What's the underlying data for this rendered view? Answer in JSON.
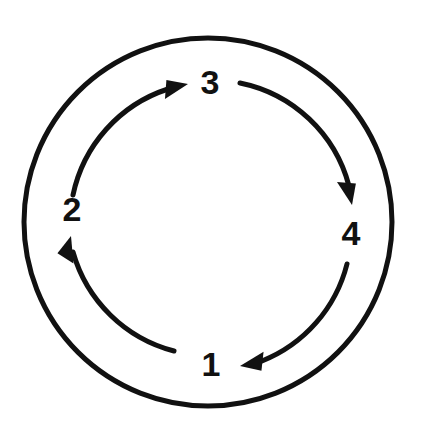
{
  "diagram": {
    "type": "cycle-diagram",
    "title": "",
    "background_color": "#ffffff",
    "ink_color": "#111111",
    "outer_ring": {
      "name": "outer-circle",
      "center_x": 208,
      "center_y": 222,
      "radius": 184,
      "stroke_width": 5
    },
    "inner_arc_radius": 142,
    "nodes": [
      {
        "id": "node-1",
        "label": "1",
        "position": "bottom",
        "x": 211,
        "y": 367
      },
      {
        "id": "node-2",
        "label": "2",
        "position": "left",
        "x": 72,
        "y": 212
      },
      {
        "id": "node-3",
        "label": "3",
        "position": "top",
        "x": 210,
        "y": 85
      },
      {
        "id": "node-4",
        "label": "4",
        "position": "right",
        "x": 351,
        "y": 236
      }
    ],
    "arrows": [
      {
        "id": "arrow-1-to-2",
        "from": "1",
        "to": "2",
        "direction": "counterclockwise-left-side",
        "arrowhead_points_toward": "2",
        "arrowhead_orientation": "up",
        "path": "M 174 351 A 142 142 0 0 1 73 252",
        "head_tip_x": 71,
        "head_tip_y": 236,
        "head_angle_deg": -76
      },
      {
        "id": "arrow-2-to-3",
        "from": "2",
        "to": "3",
        "direction": "clockwise-upper-left",
        "arrowhead_points_toward": "3",
        "arrowhead_orientation": "right",
        "path": "M 73 195 A 142 142 0 0 1 168 89",
        "head_tip_x": 188,
        "head_tip_y": 84,
        "head_angle_deg": -14
      },
      {
        "id": "arrow-3-to-4",
        "from": "3",
        "to": "4",
        "direction": "clockwise-upper-right",
        "arrowhead_points_toward": "4",
        "arrowhead_orientation": "down",
        "path": "M 240 83 A 142 142 0 0 1 349 186",
        "head_tip_x": 352,
        "head_tip_y": 205,
        "head_angle_deg": 76
      },
      {
        "id": "arrow-4-to-1",
        "from": "4",
        "to": "1",
        "direction": "clockwise-lower-right",
        "arrowhead_points_toward": "1",
        "arrowhead_orientation": "left",
        "path": "M 347 264 A 142 142 0 0 1 262 361",
        "head_tip_x": 240,
        "head_tip_y": 366,
        "head_angle_deg": 168
      }
    ],
    "flow_sequence": "1 → 2 → 3 → 4 → 1",
    "node_count": 4
  }
}
